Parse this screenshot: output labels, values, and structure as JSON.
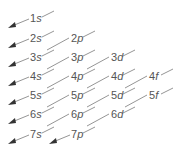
{
  "diagram": {
    "rows": [
      [
        {
          "n": "1",
          "l": "s"
        }
      ],
      [
        {
          "n": "2",
          "l": "s"
        },
        {
          "n": "2",
          "l": "p"
        }
      ],
      [
        {
          "n": "3",
          "l": "s"
        },
        {
          "n": "3",
          "l": "p"
        },
        {
          "n": "3",
          "l": "d"
        }
      ],
      [
        {
          "n": "4",
          "l": "s"
        },
        {
          "n": "4",
          "l": "p"
        },
        {
          "n": "4",
          "l": "d"
        },
        {
          "n": "4",
          "l": "f"
        }
      ],
      [
        {
          "n": "5",
          "l": "s"
        },
        {
          "n": "5",
          "l": "p"
        },
        {
          "n": "5",
          "l": "d"
        },
        {
          "n": "5",
          "l": "f"
        }
      ],
      [
        {
          "n": "6",
          "l": "s"
        },
        {
          "n": "6",
          "l": "p"
        },
        {
          "n": "6",
          "l": "d"
        }
      ],
      [
        {
          "n": "7",
          "l": "s"
        },
        {
          "n": "7",
          "l": "p"
        }
      ]
    ],
    "colors": {
      "text": "#555555",
      "line": "#7a7a7a",
      "arrow": "#333333"
    }
  }
}
